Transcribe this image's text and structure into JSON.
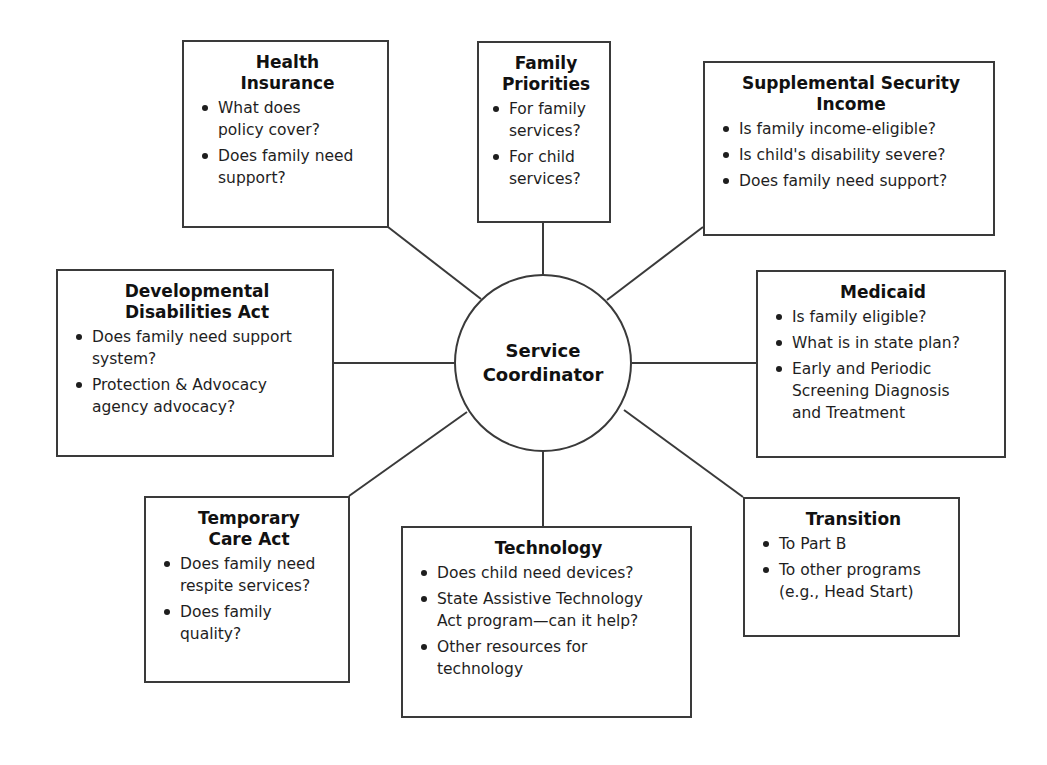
{
  "colors": {
    "stroke": "#3a3a3a",
    "text": "#1a1a1a",
    "background": "#ffffff"
  },
  "hub": {
    "label": "Service\nCoordinator"
  },
  "boxes": {
    "health_insurance": {
      "title": "Health\nInsurance",
      "items": [
        "What does\npolicy cover?",
        "Does family need\nsupport?"
      ]
    },
    "family_priorities": {
      "title": "Family\nPriorities",
      "items": [
        "For family\nservices?",
        "For child\nservices?"
      ]
    },
    "ssi": {
      "title": "Supplemental Security\nIncome",
      "items": [
        "Is family income-eligible?",
        "Is child's disability severe?",
        "Does family need support?"
      ]
    },
    "dda": {
      "title": "Developmental\nDisabilities Act",
      "items": [
        "Does family need support\nsystem?",
        "Protection & Advocacy\nagency advocacy?"
      ]
    },
    "medicaid": {
      "title": "Medicaid",
      "items": [
        "Is family eligible?",
        "What is in state plan?",
        "Early and Periodic\nScreening Diagnosis\nand Treatment"
      ]
    },
    "temporary_care": {
      "title": "Temporary\nCare Act",
      "items": [
        "Does family need\nrespite services?",
        "Does family\nquality?"
      ]
    },
    "technology": {
      "title": "Technology",
      "items": [
        "Does child need devices?",
        "State Assistive Technology\nAct program—can it help?",
        "Other resources for\ntechnology"
      ]
    },
    "transition": {
      "title": "Transition",
      "items": [
        "To Part B",
        "To other programs\n(e.g., Head Start)"
      ]
    }
  }
}
